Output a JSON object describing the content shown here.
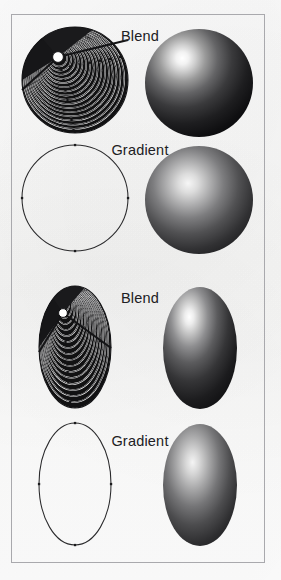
{
  "figure": {
    "background_color": "#fdfdfc",
    "border_color": "#a9a9ad",
    "ink_color": "#1a1a1a",
    "highlight_color": "#ffffff"
  },
  "rows": [
    {
      "id": "row-1",
      "label": "Blend",
      "label_x": 140,
      "label_y": 38,
      "shape": "circle",
      "left_art": "blend-construction-circle",
      "right_art": "shaded-sphere-blend"
    },
    {
      "id": "row-2",
      "label": "Gradient",
      "label_x": 140,
      "label_y": 152,
      "shape": "circle",
      "left_art": "outline-circle",
      "right_art": "shaded-sphere-gradient"
    },
    {
      "id": "row-3",
      "label": "Blend",
      "label_x": 140,
      "label_y": 300,
      "shape": "ellipse",
      "left_art": "blend-construction-ellipse",
      "right_art": "shaded-ellipsoid-blend"
    },
    {
      "id": "row-4",
      "label": "Gradient",
      "label_x": 140,
      "label_y": 443,
      "shape": "ellipse",
      "left_art": "outline-ellipse",
      "right_art": "shaded-ellipsoid-gradient"
    }
  ],
  "geometry": {
    "blend_circle": {
      "cx": 75,
      "cy": 80,
      "r": 53,
      "focus_x": 58,
      "focus_y": 57,
      "ring_count": 17,
      "white_dot_r": 5.5
    },
    "outline_circle": {
      "cx": 75,
      "cy": 198,
      "r": 53,
      "anchor_points": [
        [
          75,
          145
        ],
        [
          128,
          198
        ],
        [
          75,
          251
        ],
        [
          22,
          198
        ]
      ]
    },
    "blend_ellipse": {
      "cx": 75,
      "cy": 347,
      "rx": 36,
      "ry": 61,
      "focus_x": 63,
      "focus_y": 313,
      "ring_count": 17,
      "white_dot_r": 4.5
    },
    "outline_ellipse": {
      "cx": 75,
      "cy": 484,
      "rx": 36,
      "ry": 61,
      "anchor_points": [
        [
          75,
          423
        ],
        [
          111,
          484
        ],
        [
          75,
          545
        ],
        [
          39,
          484
        ]
      ]
    },
    "sphere_blend": {
      "cx": 199,
      "cy": 83,
      "r": 54,
      "highlight_x": 174,
      "highlight_y": 58
    },
    "sphere_gradient": {
      "cx": 199,
      "cy": 200,
      "r": 54,
      "highlight_x": 180,
      "highlight_y": 178
    },
    "ellipsoid_blend": {
      "cx": 200,
      "cy": 348,
      "rx": 37,
      "ry": 61,
      "highlight_x": 183,
      "highlight_y": 310
    },
    "ellipsoid_gradient": {
      "cx": 200,
      "cy": 485,
      "rx": 37,
      "ry": 61,
      "highlight_x": 185,
      "highlight_y": 452
    }
  }
}
